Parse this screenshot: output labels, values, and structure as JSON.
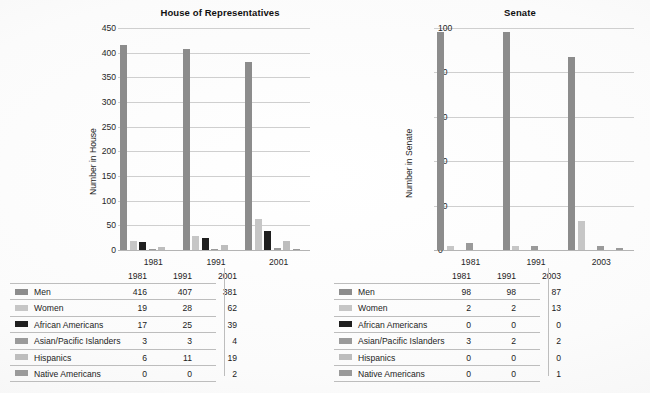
{
  "chart_data": [
    {
      "type": "bar",
      "title": "House of Representatives",
      "xlabel": "",
      "ylabel": "Number in House",
      "ylim": [
        0,
        450
      ],
      "ytick_step": 50,
      "yticks": [
        0,
        50,
        100,
        150,
        200,
        250,
        300,
        350,
        400,
        450
      ],
      "grid": true,
      "legend": "table-below",
      "categories": [
        "1981",
        "1991",
        "2001"
      ],
      "series": [
        {
          "name": "Men",
          "color": "#8c8c8c",
          "values": [
            416,
            407,
            381
          ]
        },
        {
          "name": "Women",
          "color": "#c6c6c6",
          "values": [
            19,
            28,
            62
          ]
        },
        {
          "name": "African Americans",
          "color": "#1f1f1f",
          "values": [
            17,
            25,
            39
          ]
        },
        {
          "name": "Asian/Pacific Islanders",
          "color": "#9a9a9a",
          "values": [
            3,
            3,
            4
          ]
        },
        {
          "name": "Hispanics",
          "color": "#bdbdbd",
          "values": [
            6,
            11,
            19
          ]
        },
        {
          "name": "Native Americans",
          "color": "#9a9a9a",
          "values": [
            0,
            0,
            2
          ]
        }
      ]
    },
    {
      "type": "bar",
      "title": "Senate",
      "xlabel": "",
      "ylabel": "Number in Senate",
      "ylim": [
        0,
        100
      ],
      "ytick_step": 20,
      "yticks": [
        0,
        20,
        40,
        60,
        80,
        100
      ],
      "grid": true,
      "legend": "table-below",
      "categories": [
        "1981",
        "1991",
        "2003"
      ],
      "series": [
        {
          "name": "Men",
          "color": "#8c8c8c",
          "values": [
            98,
            98,
            87
          ]
        },
        {
          "name": "Women",
          "color": "#c6c6c6",
          "values": [
            2,
            2,
            13
          ]
        },
        {
          "name": "African Americans",
          "color": "#1f1f1f",
          "values": [
            0,
            0,
            0
          ]
        },
        {
          "name": "Asian/Pacific Islanders",
          "color": "#9a9a9a",
          "values": [
            3,
            2,
            2
          ]
        },
        {
          "name": "Hispanics",
          "color": "#bdbdbd",
          "values": [
            0,
            0,
            0
          ]
        },
        {
          "name": "Native Americans",
          "color": "#9a9a9a",
          "values": [
            0,
            0,
            1
          ]
        }
      ]
    }
  ],
  "house": {
    "title": "House of Representatives",
    "y_axis_label": "Number in House",
    "y_ticks": [
      "450",
      "400",
      "350",
      "300",
      "250",
      "200",
      "150",
      "100",
      "50",
      "0"
    ],
    "x_labels": [
      "1981",
      "1991",
      "2001"
    ],
    "table": {
      "header": [
        "",
        "1981",
        "1991",
        "2001"
      ],
      "rows": [
        {
          "label": "Men",
          "swatch": "#8c8c8c",
          "values": [
            "416",
            "407",
            "381"
          ]
        },
        {
          "label": "Women",
          "swatch": "#c6c6c6",
          "values": [
            "19",
            "28",
            "62"
          ]
        },
        {
          "label": "African Americans",
          "swatch": "#1f1f1f",
          "values": [
            "17",
            "25",
            "39"
          ]
        },
        {
          "label": "Asian/Pacific Islanders",
          "swatch": "#9a9a9a",
          "values": [
            "3",
            "3",
            "4"
          ]
        },
        {
          "label": "Hispanics",
          "swatch": "#bdbdbd",
          "values": [
            "6",
            "11",
            "19"
          ]
        },
        {
          "label": "Native Americans",
          "swatch": "#9a9a9a",
          "values": [
            "0",
            "0",
            "2"
          ]
        }
      ]
    }
  },
  "senate": {
    "title": "Senate",
    "y_axis_label": "Number in Senate",
    "y_ticks": [
      "100",
      "80",
      "60",
      "40",
      "20",
      "0"
    ],
    "x_labels": [
      "1981",
      "1991",
      "2003"
    ],
    "table": {
      "header": [
        "",
        "1981",
        "1991",
        "2003"
      ],
      "rows": [
        {
          "label": "Men",
          "swatch": "#8c8c8c",
          "values": [
            "98",
            "98",
            "87"
          ]
        },
        {
          "label": "Women",
          "swatch": "#c6c6c6",
          "values": [
            "2",
            "2",
            "13"
          ]
        },
        {
          "label": "African Americans",
          "swatch": "#1f1f1f",
          "values": [
            "0",
            "0",
            "0"
          ]
        },
        {
          "label": "Asian/Pacific Islanders",
          "swatch": "#9a9a9a",
          "values": [
            "3",
            "2",
            "2"
          ]
        },
        {
          "label": "Hispanics",
          "swatch": "#bdbdbd",
          "values": [
            "0",
            "0",
            "0"
          ]
        },
        {
          "label": "Native Americans",
          "swatch": "#9a9a9a",
          "values": [
            "0",
            "0",
            "1"
          ]
        }
      ]
    }
  }
}
